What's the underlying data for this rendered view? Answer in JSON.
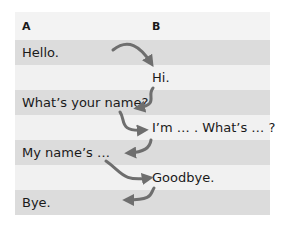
{
  "headers": {
    "a": "A",
    "b": "B"
  },
  "rows": [
    {
      "a": "Hello.",
      "b": ""
    },
    {
      "a": "",
      "b": "Hi."
    },
    {
      "a": "What’s your name?",
      "b": ""
    },
    {
      "a": "",
      "b": "I’m … . What’s … ?"
    },
    {
      "a": "My name’s …",
      "b": ""
    },
    {
      "a": "",
      "b": "Goodbye."
    },
    {
      "a": "Bye.",
      "b": ""
    }
  ],
  "colors": {
    "row_dark": "#dcdcdc",
    "row_light": "#f1f1f1",
    "arrow": "#6e6e6e"
  },
  "arrows": [
    {
      "from": "Hello.",
      "to": "Hi."
    },
    {
      "from": "Hi.",
      "to": "What’s your name?"
    },
    {
      "from": "What’s your name?",
      "to": "I’m … . What’s … ?"
    },
    {
      "from": "I’m … . What’s … ?",
      "to": "My name’s …"
    },
    {
      "from": "My name’s …",
      "to": "Goodbye."
    },
    {
      "from": "Goodbye.",
      "to": "Bye."
    }
  ]
}
